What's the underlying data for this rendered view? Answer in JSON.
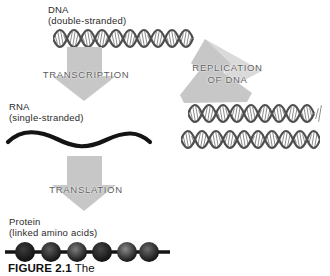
{
  "figure": {
    "caption_number": "FIGURE 2.1",
    "caption_text": "The"
  },
  "labels": {
    "dna_title": "DNA",
    "dna_sub": "(double-stranded)",
    "rna_title": "RNA",
    "rna_sub": "(single-stranded)",
    "protein_title": "Protein",
    "protein_sub": "(linked amino acids)"
  },
  "processes": {
    "transcription": "TRANSCRIPTION",
    "replication_line1": "REPLICATION",
    "replication_line2": "OF DNA",
    "translation": "TRANSLATION"
  },
  "diagram": {
    "dna_molecules_top": 1,
    "dna_molecules_replicated": 2,
    "protein_bead_count": 6
  },
  "colors": {
    "background": "#ffffff",
    "arrow_fill": "#c7c7c7",
    "arrow_fill_light": "#dadada",
    "helix_stroke": "#4e4e4e",
    "helix_hatch": "#8d8d8d",
    "process_text": "#5e5e5e",
    "label_text": "#2a2a2a",
    "rna_stroke": "#141414",
    "bead_line": "#141414",
    "bead_edge": "#0d0d0d",
    "bead_centers": [
      "#3c3c3c",
      "#5c5c5c",
      "#7d7d7d",
      "#474747",
      "#8a8a8a",
      "#6b6b6b"
    ]
  }
}
